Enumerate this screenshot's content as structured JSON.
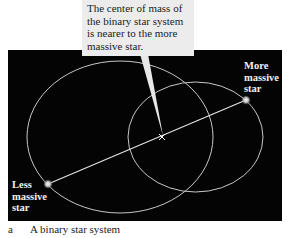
{
  "callout": {
    "lines": [
      "The center of mass of",
      "the binary star system",
      "is nearer to the more",
      "massive star."
    ]
  },
  "labels": {
    "more_massive": [
      "More",
      "massive",
      "star"
    ],
    "less_massive": [
      "Less",
      "massive",
      "star"
    ]
  },
  "caption": {
    "letter": "a",
    "text": "A binary star system"
  },
  "colors": {
    "background": "#040404",
    "orbit": "#c8c8c8",
    "callout_bg": "#ececec"
  }
}
